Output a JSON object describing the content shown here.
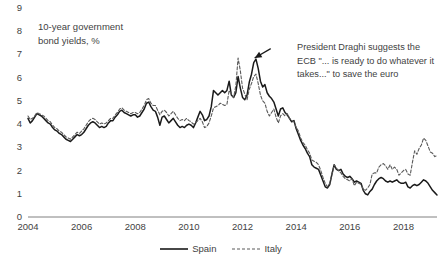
{
  "chart_data": {
    "type": "line",
    "title": "10-year government\nbond yields, %",
    "xlabel": "",
    "ylabel": "",
    "ylim": [
      0,
      9
    ],
    "xlim": [
      2004,
      2019.25
    ],
    "yticks": [
      0,
      1,
      2,
      3,
      4,
      5,
      6,
      7,
      8,
      9
    ],
    "xticks": [
      2004,
      2006,
      2008,
      2010,
      2012,
      2014,
      2016,
      2018
    ],
    "xtick_labels": [
      "2004",
      "2006",
      "2008",
      "2010",
      "2012",
      "2014",
      "2016",
      "2018"
    ],
    "ytick_labels": [
      "0",
      "1",
      "2",
      "3",
      "4",
      "5",
      "6",
      "7",
      "8",
      "9"
    ],
    "grid": false,
    "legend_position": "bottom-center",
    "annotations": [
      {
        "text": "President Draghi suggests the ECB \"... is ready to do whatever it takes...\" to save the euro",
        "arrow_from": [
          2013.05,
          7.25
        ],
        "arrow_to": [
          2012.45,
          6.85
        ]
      }
    ],
    "series": [
      {
        "name": "Spain",
        "style": "solid",
        "color": "#1a1a1a",
        "x": [
          2004.0,
          2004.083,
          2004.167,
          2004.25,
          2004.333,
          2004.417,
          2004.5,
          2004.583,
          2004.667,
          2004.75,
          2004.833,
          2004.917,
          2005.0,
          2005.083,
          2005.167,
          2005.25,
          2005.333,
          2005.417,
          2005.5,
          2005.583,
          2005.667,
          2005.75,
          2005.833,
          2005.917,
          2006.0,
          2006.083,
          2006.167,
          2006.25,
          2006.333,
          2006.417,
          2006.5,
          2006.583,
          2006.667,
          2006.75,
          2006.833,
          2006.917,
          2007.0,
          2007.083,
          2007.167,
          2007.25,
          2007.333,
          2007.417,
          2007.5,
          2007.583,
          2007.667,
          2007.75,
          2007.833,
          2007.917,
          2008.0,
          2008.083,
          2008.167,
          2008.25,
          2008.333,
          2008.417,
          2008.5,
          2008.583,
          2008.667,
          2008.75,
          2008.833,
          2008.917,
          2009.0,
          2009.083,
          2009.167,
          2009.25,
          2009.333,
          2009.417,
          2009.5,
          2009.583,
          2009.667,
          2009.75,
          2009.833,
          2009.917,
          2010.0,
          2010.083,
          2010.167,
          2010.25,
          2010.333,
          2010.417,
          2010.5,
          2010.583,
          2010.667,
          2010.75,
          2010.833,
          2010.917,
          2011.0,
          2011.083,
          2011.167,
          2011.25,
          2011.333,
          2011.417,
          2011.5,
          2011.583,
          2011.667,
          2011.75,
          2011.833,
          2011.917,
          2012.0,
          2012.083,
          2012.167,
          2012.25,
          2012.333,
          2012.417,
          2012.5,
          2012.583,
          2012.667,
          2012.75,
          2012.833,
          2012.917,
          2013.0,
          2013.083,
          2013.167,
          2013.25,
          2013.333,
          2013.417,
          2013.5,
          2013.583,
          2013.667,
          2013.75,
          2013.833,
          2013.917,
          2014.0,
          2014.083,
          2014.167,
          2014.25,
          2014.333,
          2014.417,
          2014.5,
          2014.583,
          2014.667,
          2014.75,
          2014.833,
          2014.917,
          2015.0,
          2015.083,
          2015.167,
          2015.25,
          2015.333,
          2015.417,
          2015.5,
          2015.583,
          2015.667,
          2015.75,
          2015.833,
          2015.917,
          2016.0,
          2016.083,
          2016.167,
          2016.25,
          2016.333,
          2016.417,
          2016.5,
          2016.583,
          2016.667,
          2016.75,
          2016.833,
          2016.917,
          2017.0,
          2017.083,
          2017.167,
          2017.25,
          2017.333,
          2017.417,
          2017.5,
          2017.583,
          2017.667,
          2017.75,
          2017.833,
          2017.917,
          2018.0,
          2018.083,
          2018.167,
          2018.25,
          2018.333,
          2018.417,
          2018.5,
          2018.583,
          2018.667,
          2018.75,
          2018.833,
          2018.917,
          2019.0,
          2019.083,
          2019.167,
          2019.25
        ],
        "values": [
          4.25,
          4.05,
          4.15,
          4.3,
          4.45,
          4.4,
          4.35,
          4.25,
          4.15,
          4.05,
          4.0,
          3.85,
          3.75,
          3.7,
          3.6,
          3.55,
          3.45,
          3.35,
          3.3,
          3.25,
          3.35,
          3.45,
          3.55,
          3.5,
          3.55,
          3.65,
          3.8,
          3.95,
          4.05,
          4.1,
          4.05,
          3.95,
          3.85,
          3.9,
          3.85,
          3.9,
          4.05,
          4.15,
          4.15,
          4.3,
          4.4,
          4.55,
          4.6,
          4.5,
          4.45,
          4.4,
          4.35,
          4.4,
          4.4,
          4.3,
          4.35,
          4.5,
          4.65,
          4.9,
          4.95,
          4.75,
          4.6,
          4.55,
          4.3,
          3.95,
          4.3,
          4.35,
          4.2,
          4.05,
          4.15,
          4.25,
          4.1,
          3.95,
          3.85,
          3.9,
          3.85,
          3.95,
          4.0,
          3.95,
          3.85,
          4.05,
          4.3,
          4.55,
          4.4,
          4.15,
          4.2,
          4.35,
          4.75,
          5.45,
          5.35,
          5.25,
          5.35,
          5.45,
          5.35,
          5.45,
          5.85,
          5.25,
          5.15,
          5.35,
          6.05,
          5.55,
          5.15,
          5.05,
          5.25,
          5.8,
          6.15,
          6.65,
          6.8,
          6.4,
          5.85,
          5.6,
          5.7,
          5.35,
          5.2,
          5.1,
          4.95,
          4.65,
          4.35,
          4.65,
          4.7,
          4.5,
          4.4,
          4.25,
          4.1,
          4.15,
          3.8,
          3.55,
          3.3,
          3.1,
          2.95,
          2.75,
          2.6,
          2.25,
          2.15,
          2.1,
          2.05,
          1.8,
          1.55,
          1.3,
          1.25,
          1.4,
          1.85,
          2.25,
          2.05,
          2.0,
          2.05,
          1.85,
          1.75,
          1.7,
          1.75,
          1.65,
          1.5,
          1.55,
          1.5,
          1.45,
          1.15,
          1.0,
          0.95,
          1.1,
          1.2,
          1.4,
          1.55,
          1.65,
          1.7,
          1.65,
          1.55,
          1.5,
          1.55,
          1.5,
          1.55,
          1.6,
          1.5,
          1.45,
          1.45,
          1.5,
          1.3,
          1.25,
          1.35,
          1.4,
          1.35,
          1.4,
          1.5,
          1.6,
          1.55,
          1.45,
          1.3,
          1.15,
          1.05,
          0.95
        ]
      },
      {
        "name": "Italy",
        "style": "dashed",
        "color": "#5a5a5a",
        "x": [
          2004.0,
          2004.083,
          2004.167,
          2004.25,
          2004.333,
          2004.417,
          2004.5,
          2004.583,
          2004.667,
          2004.75,
          2004.833,
          2004.917,
          2005.0,
          2005.083,
          2005.167,
          2005.25,
          2005.333,
          2005.417,
          2005.5,
          2005.583,
          2005.667,
          2005.75,
          2005.833,
          2005.917,
          2006.0,
          2006.083,
          2006.167,
          2006.25,
          2006.333,
          2006.417,
          2006.5,
          2006.583,
          2006.667,
          2006.75,
          2006.833,
          2006.917,
          2007.0,
          2007.083,
          2007.167,
          2007.25,
          2007.333,
          2007.417,
          2007.5,
          2007.583,
          2007.667,
          2007.75,
          2007.833,
          2007.917,
          2008.0,
          2008.083,
          2008.167,
          2008.25,
          2008.333,
          2008.417,
          2008.5,
          2008.583,
          2008.667,
          2008.75,
          2008.833,
          2008.917,
          2009.0,
          2009.083,
          2009.167,
          2009.25,
          2009.333,
          2009.417,
          2009.5,
          2009.583,
          2009.667,
          2009.75,
          2009.833,
          2009.917,
          2010.0,
          2010.083,
          2010.167,
          2010.25,
          2010.333,
          2010.417,
          2010.5,
          2010.583,
          2010.667,
          2010.75,
          2010.833,
          2010.917,
          2011.0,
          2011.083,
          2011.167,
          2011.25,
          2011.333,
          2011.417,
          2011.5,
          2011.583,
          2011.667,
          2011.75,
          2011.833,
          2011.917,
          2012.0,
          2012.083,
          2012.167,
          2012.25,
          2012.333,
          2012.417,
          2012.5,
          2012.583,
          2012.667,
          2012.75,
          2012.833,
          2012.917,
          2013.0,
          2013.083,
          2013.167,
          2013.25,
          2013.333,
          2013.417,
          2013.5,
          2013.583,
          2013.667,
          2013.75,
          2013.833,
          2013.917,
          2014.0,
          2014.083,
          2014.167,
          2014.25,
          2014.333,
          2014.417,
          2014.5,
          2014.583,
          2014.667,
          2014.75,
          2014.833,
          2014.917,
          2015.0,
          2015.083,
          2015.167,
          2015.25,
          2015.333,
          2015.417,
          2015.5,
          2015.583,
          2015.667,
          2015.75,
          2015.833,
          2015.917,
          2016.0,
          2016.083,
          2016.167,
          2016.25,
          2016.333,
          2016.417,
          2016.5,
          2016.583,
          2016.667,
          2016.75,
          2016.833,
          2016.917,
          2017.0,
          2017.083,
          2017.167,
          2017.25,
          2017.333,
          2017.417,
          2017.5,
          2017.583,
          2017.667,
          2017.75,
          2017.833,
          2017.917,
          2018.0,
          2018.083,
          2018.167,
          2018.25,
          2018.333,
          2018.417,
          2018.5,
          2018.583,
          2018.667,
          2018.75,
          2018.833,
          2018.917,
          2019.0,
          2019.083,
          2019.167,
          2019.25
        ],
        "values": [
          4.35,
          4.2,
          4.25,
          4.35,
          4.5,
          4.45,
          4.4,
          4.35,
          4.25,
          4.15,
          4.1,
          3.95,
          3.85,
          3.8,
          3.7,
          3.65,
          3.55,
          3.45,
          3.4,
          3.35,
          3.45,
          3.55,
          3.65,
          3.6,
          3.7,
          3.8,
          3.95,
          4.1,
          4.2,
          4.25,
          4.2,
          4.1,
          4.0,
          4.05,
          4.0,
          4.05,
          4.15,
          4.25,
          4.25,
          4.4,
          4.5,
          4.65,
          4.7,
          4.6,
          4.55,
          4.5,
          4.45,
          4.5,
          4.5,
          4.45,
          4.5,
          4.65,
          4.8,
          5.05,
          5.1,
          4.9,
          4.8,
          4.8,
          4.6,
          4.4,
          4.55,
          4.6,
          4.5,
          4.35,
          4.45,
          4.55,
          4.4,
          4.25,
          4.15,
          4.2,
          4.15,
          4.25,
          4.15,
          4.1,
          4.0,
          4.05,
          4.15,
          4.25,
          4.1,
          3.85,
          3.9,
          4.05,
          4.35,
          4.7,
          4.75,
          4.8,
          4.9,
          4.85,
          4.8,
          4.85,
          5.45,
          5.3,
          5.15,
          5.65,
          6.85,
          6.3,
          5.55,
          5.3,
          5.05,
          5.5,
          5.75,
          6.05,
          6.15,
          5.75,
          5.25,
          5.0,
          4.9,
          4.55,
          4.35,
          4.5,
          4.65,
          4.3,
          4.05,
          4.35,
          4.45,
          4.35,
          4.45,
          4.25,
          4.15,
          4.1,
          3.85,
          3.7,
          3.4,
          3.2,
          3.1,
          2.9,
          2.75,
          2.45,
          2.4,
          2.35,
          2.25,
          2.0,
          1.7,
          1.45,
          1.3,
          1.45,
          1.85,
          2.25,
          2.1,
          2.0,
          1.9,
          1.75,
          1.65,
          1.6,
          1.55,
          1.65,
          1.35,
          1.5,
          1.45,
          1.4,
          1.2,
          1.15,
          1.25,
          1.4,
          1.85,
          1.9,
          1.9,
          2.15,
          2.25,
          2.3,
          2.2,
          2.05,
          2.25,
          2.05,
          2.15,
          2.05,
          1.8,
          1.9,
          2.0,
          2.05,
          1.85,
          1.8,
          2.35,
          2.85,
          2.7,
          2.95,
          3.1,
          3.4,
          3.3,
          3.05,
          2.8,
          2.75,
          2.6,
          2.65
        ]
      }
    ]
  }
}
